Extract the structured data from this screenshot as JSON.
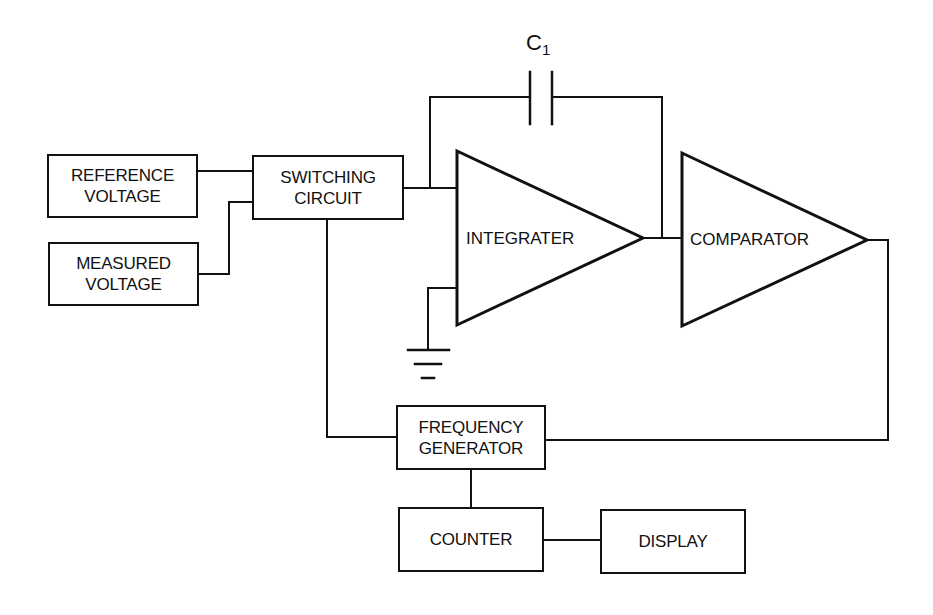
{
  "diagram": {
    "blocks": {
      "reference_voltage": {
        "line1": "REFERENCE",
        "line2": "VOLTAGE"
      },
      "measured_voltage": {
        "line1": "MEASURED",
        "line2": "VOLTAGE"
      },
      "switching_circuit": {
        "line1": "SWITCHING",
        "line2": "CIRCUIT"
      },
      "integrater": {
        "label": "INTEGRATER"
      },
      "comparator": {
        "label": "COMPARATOR"
      },
      "frequency_generator": {
        "line1": "FREQUENCY",
        "line2": "GENERATOR"
      },
      "counter": {
        "label": "COUNTER"
      },
      "display": {
        "label": "DISPLAY"
      }
    },
    "capacitor": {
      "symbol": "C",
      "subscript": "1"
    },
    "connections": [
      "reference_voltage -> switching_circuit",
      "measured_voltage -> switching_circuit",
      "switching_circuit -> integrater",
      "integrater -> comparator (with C1 feedback)",
      "integrater -> ground",
      "comparator -> frequency_generator",
      "frequency_generator -> switching_circuit",
      "frequency_generator -> counter",
      "counter -> display"
    ],
    "colors": {
      "line": "#111111",
      "background": "#ffffff"
    }
  }
}
